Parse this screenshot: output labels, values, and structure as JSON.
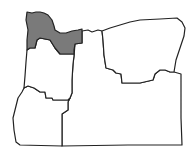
{
  "map": {
    "subject": "Oregon regions",
    "highlighted_region": "northwest",
    "colors": {
      "highlight": "#7a7a7a",
      "default": "#ffffff",
      "border": "#222222"
    },
    "regions": [
      {
        "id": "northwest",
        "highlighted": true
      },
      {
        "id": "willamette-valley",
        "highlighted": false
      },
      {
        "id": "southwest",
        "highlighted": false
      },
      {
        "id": "north-central",
        "highlighted": false
      },
      {
        "id": "northeast",
        "highlighted": false
      },
      {
        "id": "south-central-southeast",
        "highlighted": false
      }
    ]
  }
}
